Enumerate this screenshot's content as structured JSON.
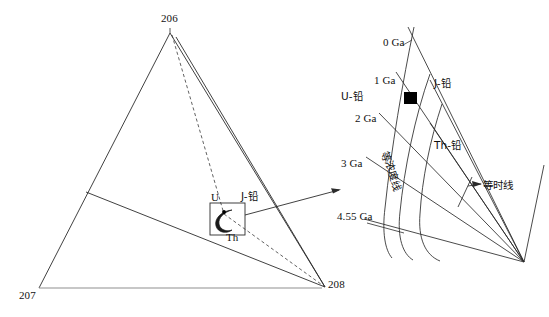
{
  "figure": {
    "line_color": "#2b2b2b",
    "base_line_color": "#8c8c8c",
    "marker_color": "#000000"
  },
  "ternary": {
    "vertices": [
      {
        "id": "vertex-206",
        "label": "206",
        "x": 170,
        "y": 22
      },
      {
        "id": "vertex-207",
        "label": "207",
        "x": 28,
        "y": 297
      },
      {
        "id": "vertex-208",
        "label": "208",
        "x": 330,
        "y": 288
      }
    ],
    "inner_labels": [
      {
        "id": "label-u",
        "label": "U",
        "x": 213,
        "y": 197
      },
      {
        "id": "label-th",
        "label": "Th",
        "x": 229,
        "y": 236
      },
      {
        "id": "label-j-lead",
        "label": "J-铅",
        "x": 243,
        "y": 196
      }
    ]
  },
  "inset": {
    "age_labels": [
      {
        "id": "age-0ga",
        "label": "0 Ga",
        "x": 386,
        "y": 43
      },
      {
        "id": "age-1ga",
        "label": "1 Ga",
        "x": 377,
        "y": 80
      },
      {
        "id": "age-2ga",
        "label": "2 Ga",
        "x": 358,
        "y": 118
      },
      {
        "id": "age-3ga",
        "label": "3 Ga",
        "x": 344,
        "y": 163
      },
      {
        "id": "age-455ga",
        "label": "4.55 Ga",
        "x": 340,
        "y": 216
      }
    ],
    "series_labels": [
      {
        "id": "label-u-lead",
        "label": "U-铅",
        "x": 343,
        "y": 96
      },
      {
        "id": "label-j-lead",
        "label": "J-铅",
        "x": 437,
        "y": 83
      },
      {
        "id": "label-th-lead",
        "label": "Th-铅",
        "x": 437,
        "y": 145
      }
    ],
    "annotations": [
      {
        "id": "label-isochron",
        "label": "等时线",
        "x": 482,
        "y": 185
      },
      {
        "id": "label-isoconcentration",
        "label": "等浓度线",
        "x": 393,
        "y": 151
      }
    ],
    "sample_marker": {
      "id": "sample-point",
      "label": "",
      "x": 408,
      "y": 98
    }
  }
}
